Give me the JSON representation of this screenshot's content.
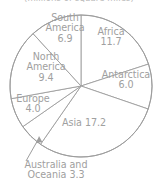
{
  "chart_title": "(millions of square miles)",
  "labels": {
    "africa": "Africa\n11.7",
    "antarctica": "Antarctica\n6.0",
    "asia": "Asia 17.2",
    "australia": "Australia and\nOceania 3.3",
    "europe": "Europe\n4.0",
    "north_america": "North\nAmerica\n9.4",
    "south_america": "South\nAmerica\n6.9"
  },
  "chart_data": {
    "type": "pie",
    "title": "(millions of square miles)",
    "unit": "millions of square miles",
    "categories": [
      "Africa",
      "Antarctica",
      "Asia",
      "Australia and Oceania",
      "Europe",
      "North America",
      "South America"
    ],
    "values": [
      11.7,
      6.0,
      17.2,
      3.3,
      4.0,
      9.4,
      6.9
    ],
    "total": 58.5,
    "start_angle_deg": 0,
    "direction": "clockwise",
    "slice_order": [
      "Africa",
      "Antarctica",
      "Asia",
      "Australia and Oceania",
      "Europe",
      "North America",
      "South America"
    ],
    "data_labels": [
      "Africa 11.7",
      "Antarctica 6.0",
      "Asia 17.2",
      "Australia and Oceania 3.3",
      "Europe 4.0",
      "North America 9.4",
      "South America 6.9"
    ],
    "annotations": [
      {
        "text": "Australia and Oceania 3.3",
        "kind": "callout-with-arrow",
        "points_to": "Australia and Oceania"
      }
    ],
    "legend": false,
    "grid": false,
    "colors": {
      "slice_fill": "#ffffff",
      "slice_stroke": "#9d9d9d",
      "label_text": "#a0a0a0",
      "background": "#ffffff"
    }
  },
  "geometry": {
    "center_x": 81,
    "center_y": 86,
    "radius": 71
  }
}
